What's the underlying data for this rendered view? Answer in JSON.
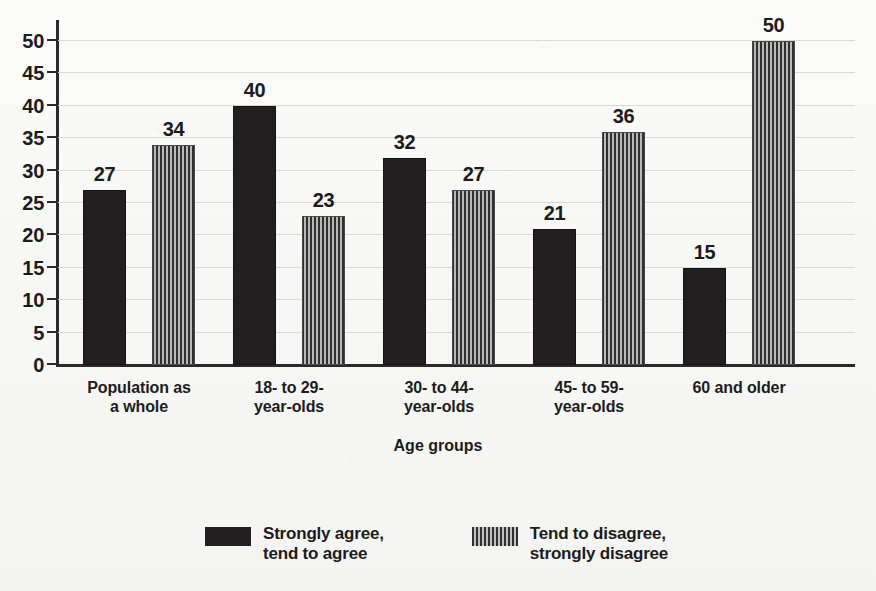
{
  "chart_data": {
    "type": "bar",
    "title": "",
    "xlabel": "Age groups",
    "ylabel": "",
    "ylim": [
      0,
      52
    ],
    "yticks": [
      0,
      5,
      10,
      15,
      20,
      25,
      30,
      35,
      40,
      45,
      50
    ],
    "grid": true,
    "legend_position": "bottom",
    "categories": [
      "Population as\na whole",
      "18- to 29-\nyear-olds",
      "30- to 44-\nyear-olds",
      "45- to 59-\nyear-olds",
      "60 and older"
    ],
    "series": [
      {
        "name": "Strongly agree,\ntend to agree",
        "values": [
          27,
          40,
          32,
          21,
          15
        ],
        "color": "#231f20",
        "fill": "solid"
      },
      {
        "name": "Tend to disagree,\nstrongly disagree",
        "values": [
          34,
          23,
          27,
          36,
          50
        ],
        "color": "#6d6d6d",
        "fill": "vertical-stripes"
      }
    ]
  },
  "axis": {
    "x_title": "Age groups",
    "tick_labels": [
      "0",
      "5",
      "10",
      "15",
      "20",
      "25",
      "30",
      "35",
      "40",
      "45",
      "50"
    ]
  },
  "legend": {
    "items": [
      {
        "label": "Strongly agree,\ntend to agree",
        "swatch": "solid-dark-swatch"
      },
      {
        "label": "Tend to disagree,\nstrongly disagree",
        "swatch": "striped-swatch"
      }
    ]
  },
  "colors": {
    "series_solid": "#231f20",
    "series_striped": "#6d6d6d",
    "axis": "#2a2a2a",
    "gridline": "#d8d8d4",
    "background": "#f7f7f5",
    "text": "#1c1c1c"
  }
}
